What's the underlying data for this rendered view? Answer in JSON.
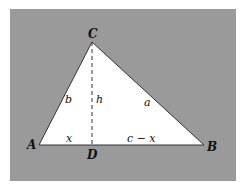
{
  "diagram": {
    "background_color": "#9a9a9a",
    "triangle_fill": "#ffffff",
    "stroke_color": "#333333",
    "vertices": {
      "A": {
        "label": "A",
        "x": 39,
        "y": 145
      },
      "B": {
        "label": "B",
        "x": 204,
        "y": 145
      },
      "C": {
        "label": "C",
        "x": 92,
        "y": 42
      },
      "D": {
        "label": "D",
        "x": 92,
        "y": 145
      }
    },
    "segment_labels": {
      "b": "b",
      "h": "h",
      "a": "a",
      "x": "x",
      "c_minus_x": "c − x"
    },
    "altitude": {
      "from": "C",
      "to": "D",
      "style": "dashed"
    }
  }
}
